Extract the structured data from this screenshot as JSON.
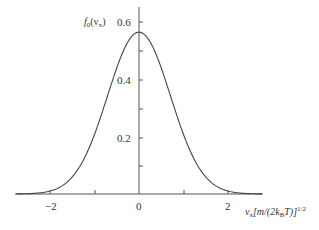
{
  "chart_data": {
    "type": "line",
    "title": "",
    "xlabel": "v_x[m/(2k_B T)]^{1/2}",
    "ylabel": "f_0(v_x)",
    "xlim": [
      -2.8,
      2.8
    ],
    "ylim": [
      0,
      0.65
    ],
    "grid": false,
    "legend": null,
    "x_ticks": [
      -2,
      -1,
      0,
      1,
      2
    ],
    "x_tick_labels": [
      "−2",
      "",
      "0",
      "",
      "2"
    ],
    "y_ticks": [
      0.1,
      0.2,
      0.3,
      0.4,
      0.5,
      0.6
    ],
    "y_tick_labels": [
      "",
      "0.2",
      "",
      "0.4",
      "",
      "0.6"
    ],
    "series": [
      {
        "name": "f0(vx) = (1/√π) exp(−x²)",
        "function": "gaussian",
        "peak": 0.564,
        "x": [
          -2.8,
          -2.5,
          -2.0,
          -1.5,
          -1.0,
          -0.5,
          0.0,
          0.5,
          1.0,
          1.5,
          2.0,
          2.5,
          2.8
        ],
        "values": [
          0.0002,
          0.0011,
          0.0103,
          0.0595,
          0.2076,
          0.4394,
          0.5642,
          0.4394,
          0.2076,
          0.0595,
          0.0103,
          0.0011,
          0.0002
        ]
      }
    ]
  },
  "labels": {
    "y_axis_name_main": "f",
    "y_axis_name_sub": "0",
    "y_axis_name_arg": "(v",
    "y_axis_name_arg_sub": "x",
    "y_axis_name_close": ")",
    "x_axis_v": "v",
    "x_axis_v_sub": "x",
    "x_axis_bracket": "[m/(2k",
    "x_axis_kb_sub": "B",
    "x_axis_T": "T)]",
    "x_axis_exp": "1/2",
    "y_tick_06": "0.6",
    "y_tick_04": "0.4",
    "y_tick_02": "0.2",
    "x_tick_m2": "−2",
    "x_tick_0": "0",
    "x_tick_2": "2"
  }
}
